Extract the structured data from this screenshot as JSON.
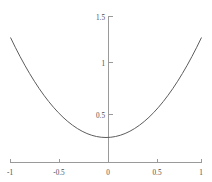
{
  "chart_data": {
    "type": "line",
    "title": "",
    "subtitle": "",
    "xlabel": "",
    "ylabel": "",
    "xlim": [
      -1,
      1
    ],
    "ylim": [
      0,
      1.5
    ],
    "grid": false,
    "legend": null,
    "x_ticks": [
      -1,
      -0.5,
      0,
      0.5,
      1
    ],
    "x_tick_labels": [
      "-1",
      "-0.5",
      "0",
      "0.5",
      "1"
    ],
    "y_ticks": [
      0.5,
      1,
      1.5
    ],
    "y_tick_labels": [
      "0.5",
      "1",
      "1.5"
    ],
    "series": [
      {
        "name": "y = x^2 + 0.25",
        "color": "#5d5d5d",
        "x": [
          -1,
          -0.95,
          -0.9,
          -0.85,
          -0.8,
          -0.75,
          -0.7,
          -0.65,
          -0.6,
          -0.55,
          -0.5,
          -0.45,
          -0.4,
          -0.35,
          -0.3,
          -0.25,
          -0.2,
          -0.15,
          -0.1,
          -0.05,
          0,
          0.05,
          0.1,
          0.15,
          0.2,
          0.25,
          0.3,
          0.35,
          0.4,
          0.45,
          0.5,
          0.55,
          0.6,
          0.65,
          0.7,
          0.75,
          0.8,
          0.85,
          0.9,
          0.95,
          1
        ],
        "y": [
          1.25,
          1.1525,
          1.06,
          0.9725,
          0.89,
          0.8125,
          0.74,
          0.6725,
          0.61,
          0.5525,
          0.5,
          0.4525,
          0.41,
          0.3725,
          0.34,
          0.3125,
          0.29,
          0.2725,
          0.26,
          0.2525,
          0.25,
          0.2525,
          0.26,
          0.2725,
          0.29,
          0.3125,
          0.34,
          0.3725,
          0.41,
          0.4525,
          0.5,
          0.5525,
          0.61,
          0.6725,
          0.74,
          0.8125,
          0.89,
          0.9725,
          1.06,
          1.1525,
          1.25
        ]
      }
    ],
    "axis_color": "#9a9a9a",
    "background_color": "#ffffff"
  },
  "axes": {
    "x_axis_name": "x-axis",
    "y_axis_name": "y-axis"
  }
}
